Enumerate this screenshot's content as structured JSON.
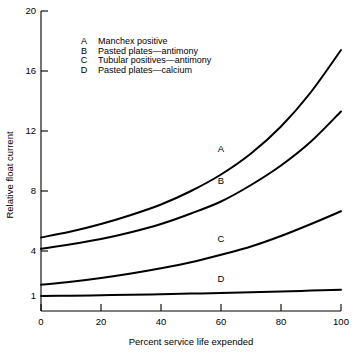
{
  "chart_data": {
    "type": "line",
    "title": "",
    "xlabel": "Percent service life expended",
    "ylabel": "Relative float current",
    "xlim": [
      0,
      100
    ],
    "ylim": [
      0,
      20
    ],
    "xticks": [
      "0",
      "20",
      "40",
      "60",
      "80",
      "100"
    ],
    "xtick_values": [
      0,
      20,
      40,
      60,
      80,
      100
    ],
    "yticks": [
      "1",
      "4",
      "8",
      "12",
      "16",
      "20"
    ],
    "ytick_values": [
      1,
      4,
      8,
      12,
      16,
      20
    ],
    "grid": false,
    "legend_position": "upper-left-inside",
    "x": [
      0,
      10,
      20,
      30,
      40,
      50,
      60,
      70,
      80,
      90,
      100
    ],
    "series": [
      {
        "name": "A",
        "key": "A",
        "label": "Manchex positive",
        "values": [
          4.9,
          5.3,
          5.8,
          6.4,
          7.1,
          8.0,
          9.1,
          10.5,
          12.3,
          14.6,
          17.4
        ],
        "label_x": 60,
        "label_y": 10.6
      },
      {
        "name": "B",
        "key": "B",
        "label": "Pasted plates—antimony",
        "values": [
          4.15,
          4.45,
          4.8,
          5.25,
          5.8,
          6.5,
          7.3,
          8.4,
          9.7,
          11.3,
          13.3
        ],
        "label_x": 60,
        "label_y": 8.5
      },
      {
        "name": "C",
        "key": "C",
        "label": "Tubular positives—antimony",
        "values": [
          1.75,
          1.95,
          2.2,
          2.5,
          2.85,
          3.25,
          3.75,
          4.3,
          5.0,
          5.8,
          6.65
        ],
        "label_x": 60,
        "label_y": 4.6
      },
      {
        "name": "D",
        "key": "D",
        "label": "Pasted plates—calcium",
        "values": [
          1.0,
          1.02,
          1.05,
          1.08,
          1.12,
          1.16,
          1.2,
          1.25,
          1.3,
          1.36,
          1.42
        ],
        "label_x": 60,
        "label_y": 1.95
      }
    ],
    "legend": [
      {
        "key": "A",
        "label": "Manchex positive"
      },
      {
        "key": "B",
        "label": "Pasted plates—antimony"
      },
      {
        "key": "C",
        "label": "Tubular positives—antimony"
      },
      {
        "key": "D",
        "label": "Pasted plates—calcium"
      }
    ],
    "colors": {
      "line": "#000000",
      "axis": "#000000",
      "background": "#ffffff",
      "text": "#000000"
    }
  }
}
